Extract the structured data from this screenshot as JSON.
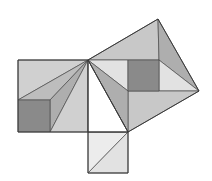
{
  "diagram": {
    "title": "Pythagorean theorem dissection proof",
    "kind": "geometric-dissection",
    "colors": {
      "outline": "#3a3a3a",
      "light": "#d0d0d0",
      "lighter": "#e2e2e2",
      "very_light": "#ececec",
      "medium": "#bdbdbd",
      "mid_dark": "#aeaeae",
      "dark": "#8a8a8a",
      "white": "#ffffff",
      "background": "#ffffff"
    },
    "triangle": {
      "name": "right-triangle",
      "vertices": [
        [
          88,
          60
        ],
        [
          88,
          132
        ],
        [
          128,
          132
        ]
      ],
      "fill": "#ffffff"
    },
    "shapes": [
      {
        "id": "left-square-top",
        "group": "left-square",
        "points": [
          [
            18,
            60
          ],
          [
            88,
            60
          ],
          [
            18,
            100
          ]
        ],
        "fill": "#d0d0d0"
      },
      {
        "id": "left-square-fan-1",
        "group": "left-square",
        "points": [
          [
            18,
            100
          ],
          [
            88,
            60
          ],
          [
            50,
            100
          ]
        ],
        "fill": "#bdbdbd"
      },
      {
        "id": "left-square-fan-2",
        "group": "left-square",
        "points": [
          [
            50,
            100
          ],
          [
            88,
            60
          ],
          [
            50,
            132
          ]
        ],
        "fill": "#aeaeae"
      },
      {
        "id": "left-square-bottom",
        "group": "left-square",
        "points": [
          [
            50,
            132
          ],
          [
            88,
            60
          ],
          [
            88,
            132
          ]
        ],
        "fill": "#d0d0d0"
      },
      {
        "id": "left-square-core",
        "group": "left-square",
        "points": [
          [
            18,
            100
          ],
          [
            50,
            100
          ],
          [
            50,
            132
          ],
          [
            18,
            132
          ]
        ],
        "fill": "#8a8a8a"
      },
      {
        "id": "bottom-square-upper",
        "group": "bottom-square",
        "points": [
          [
            88,
            132
          ],
          [
            128,
            132
          ],
          [
            88,
            173
          ]
        ],
        "fill": "#ececec"
      },
      {
        "id": "bottom-square-lower",
        "group": "bottom-square",
        "points": [
          [
            128,
            132
          ],
          [
            128,
            173
          ],
          [
            88,
            173
          ]
        ],
        "fill": "#e2e2e2"
      },
      {
        "id": "hyp-square-top",
        "group": "hypotenuse-square",
        "points": [
          [
            88,
            60
          ],
          [
            158,
            19
          ],
          [
            159,
            60
          ],
          [
            128,
            60
          ]
        ],
        "fill": "#c8c8c8"
      },
      {
        "id": "hyp-square-right-dark",
        "group": "hypotenuse-square",
        "points": [
          [
            158,
            19
          ],
          [
            199,
            91
          ],
          [
            159,
            60
          ]
        ],
        "fill": "#aeaeae"
      },
      {
        "id": "hyp-square-right-light",
        "group": "hypotenuse-square",
        "points": [
          [
            159,
            60
          ],
          [
            199,
            91
          ],
          [
            159,
            91
          ]
        ],
        "fill": "#e2e2e2"
      },
      {
        "id": "hyp-square-bottom",
        "group": "hypotenuse-square",
        "points": [
          [
            128,
            91
          ],
          [
            199,
            91
          ],
          [
            128,
            132
          ]
        ],
        "fill": "#c8c8c8"
      },
      {
        "id": "hyp-square-left-light",
        "group": "hypotenuse-square",
        "points": [
          [
            88,
            60
          ],
          [
            128,
            60
          ],
          [
            128,
            91
          ]
        ],
        "fill": "#e2e2e2"
      },
      {
        "id": "hyp-square-left-dark",
        "group": "hypotenuse-square",
        "points": [
          [
            88,
            60
          ],
          [
            128,
            91
          ],
          [
            128,
            132
          ]
        ],
        "fill": "#aeaeae"
      },
      {
        "id": "hyp-square-core",
        "group": "hypotenuse-square",
        "points": [
          [
            128,
            60
          ],
          [
            159,
            60
          ],
          [
            159,
            91
          ],
          [
            128,
            91
          ]
        ],
        "fill": "#8a8a8a"
      }
    ],
    "outlines": [
      {
        "id": "left-square-outline",
        "points": [
          [
            18,
            60
          ],
          [
            88,
            60
          ],
          [
            88,
            132
          ],
          [
            18,
            132
          ]
        ]
      },
      {
        "id": "bottom-square-outline",
        "points": [
          [
            88,
            132
          ],
          [
            128,
            132
          ],
          [
            128,
            173
          ],
          [
            88,
            173
          ]
        ]
      },
      {
        "id": "hypotenuse-square-outline",
        "points": [
          [
            88,
            60
          ],
          [
            158,
            19
          ],
          [
            199,
            91
          ],
          [
            128,
            132
          ]
        ]
      }
    ]
  }
}
